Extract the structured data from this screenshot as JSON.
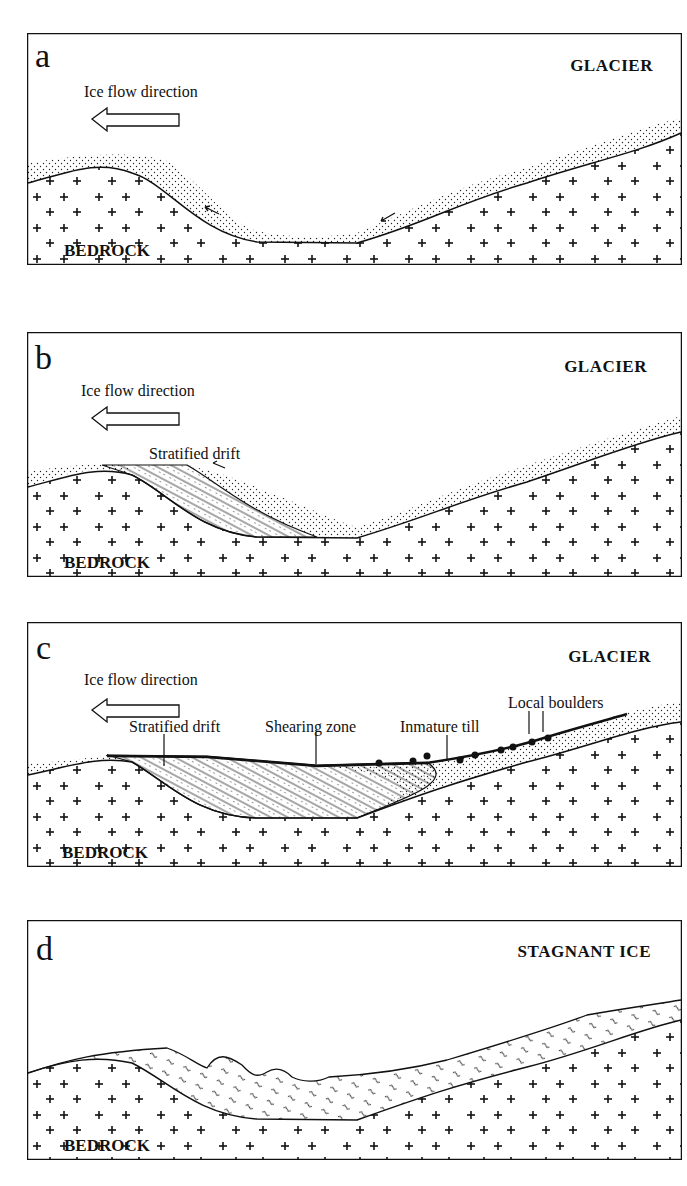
{
  "figure": {
    "panels": [
      {
        "letter": "a",
        "title": "GLACIER",
        "arrow_label": "Ice flow direction",
        "bedrock_label": "BEDROCK",
        "annotations": []
      },
      {
        "letter": "b",
        "title": "GLACIER",
        "arrow_label": "Ice flow direction",
        "bedrock_label": "BEDROCK",
        "annotations": [
          "Stratified drift"
        ]
      },
      {
        "letter": "c",
        "title": "GLACIER",
        "arrow_label": "Ice flow direction",
        "bedrock_label": "BEDROCK",
        "annotations": [
          "Stratified drift",
          "Shearing zone",
          "Inmature till",
          "Local boulders"
        ]
      },
      {
        "letter": "d",
        "title": "STAGNANT ICE",
        "arrow_label": "",
        "bedrock_label": "BEDROCK",
        "annotations": []
      }
    ],
    "icons": {
      "arrow": "left-arrow-outline",
      "bedrock_pattern": "plus-signs",
      "sediment_pattern": "stipple-dots",
      "boulder": "filled-teardrop"
    },
    "colors": {
      "ink": "#111111",
      "background": "#ffffff"
    }
  }
}
